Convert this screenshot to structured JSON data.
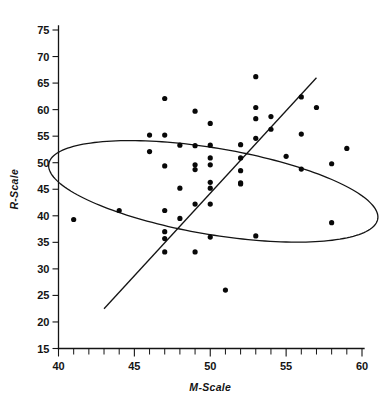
{
  "chart_data": {
    "type": "scatter",
    "title": "",
    "xlabel": "M-Scale",
    "ylabel": "R-Scale",
    "xlim": [
      40,
      60
    ],
    "ylim": [
      15,
      75
    ],
    "grid": false,
    "legend": null,
    "x_ticks_major": [
      40,
      45,
      50,
      55,
      60
    ],
    "x_tick_labels": [
      "40",
      "45",
      "50",
      "55",
      "60"
    ],
    "x_ticks_minor_step": 1,
    "y_ticks_major": [
      15,
      20,
      25,
      30,
      35,
      40,
      45,
      50,
      55,
      60,
      65,
      70,
      75
    ],
    "y_tick_labels": [
      "15",
      "20",
      "25",
      "30",
      "35",
      "40",
      "45",
      "50",
      "55",
      "60",
      "65",
      "70",
      "75"
    ],
    "points": [
      [
        41.0,
        39.3
      ],
      [
        44.0,
        41.0
      ],
      [
        46.0,
        55.2
      ],
      [
        46.0,
        52.1
      ],
      [
        47.0,
        62.1
      ],
      [
        47.0,
        55.2
      ],
      [
        47.0,
        49.4
      ],
      [
        47.0,
        41.0
      ],
      [
        47.0,
        37.0
      ],
      [
        47.0,
        35.7
      ],
      [
        47.0,
        33.2
      ],
      [
        48.0,
        53.3
      ],
      [
        48.0,
        45.2
      ],
      [
        48.0,
        39.5
      ],
      [
        49.0,
        59.7
      ],
      [
        49.0,
        53.2
      ],
      [
        49.0,
        49.6
      ],
      [
        49.0,
        48.7
      ],
      [
        49.0,
        42.2
      ],
      [
        49.0,
        33.2
      ],
      [
        50.0,
        57.4
      ],
      [
        50.0,
        53.3
      ],
      [
        50.0,
        50.9
      ],
      [
        50.0,
        49.6
      ],
      [
        50.0,
        46.3
      ],
      [
        50.0,
        45.2
      ],
      [
        50.0,
        42.2
      ],
      [
        50.0,
        36.0
      ],
      [
        51.0,
        26.0
      ],
      [
        52.0,
        53.4
      ],
      [
        52.0,
        50.9
      ],
      [
        52.0,
        48.5
      ],
      [
        52.0,
        46.2
      ],
      [
        52.0,
        46.0
      ],
      [
        53.0,
        66.2
      ],
      [
        53.0,
        60.4
      ],
      [
        53.0,
        58.3
      ],
      [
        53.0,
        54.6
      ],
      [
        53.0,
        36.2
      ],
      [
        54.0,
        58.7
      ],
      [
        54.0,
        56.3
      ],
      [
        55.0,
        51.2
      ],
      [
        56.0,
        62.4
      ],
      [
        56.0,
        55.4
      ],
      [
        56.0,
        48.8
      ],
      [
        57.0,
        60.4
      ],
      [
        58.0,
        49.8
      ],
      [
        58.0,
        38.7
      ],
      [
        59.0,
        52.7
      ]
    ],
    "regression_line": {
      "x_start": 43.0,
      "y_start": 22.5,
      "x_end": 57.0,
      "y_end": 66.0
    },
    "confidence_ellipse": {
      "center_x": 50.2,
      "center_y": 44.6,
      "semi_major": 12.6,
      "semi_minor": 7.1,
      "rotation_deg": -38.0
    }
  }
}
